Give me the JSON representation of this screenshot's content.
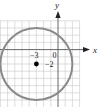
{
  "figure": {
    "type": "coordinate-plane-circle",
    "axes": {
      "x_label": "x",
      "y_label": "y"
    },
    "grid": {
      "unit_px": 7.2,
      "origin_px": [
        58,
        49.6
      ],
      "x_range": [
        -8,
        3
      ],
      "y_range": [
        -8,
        4
      ]
    },
    "circle": {
      "center": [
        -3,
        -2
      ],
      "radius": 5,
      "stroke_color": "#8a8a8a"
    },
    "center_point": {
      "label_x": "−3",
      "label_y": "−2",
      "color": "#000000"
    },
    "origin_label": "0"
  }
}
